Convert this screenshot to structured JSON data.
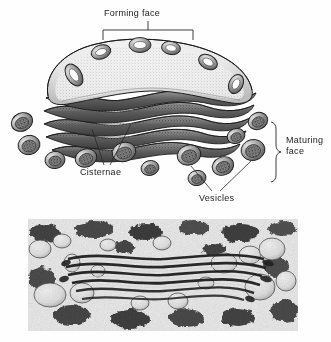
{
  "figure": {
    "title_text": "",
    "background_color": "#fefefe",
    "ink_color": "#1a1a1a"
  },
  "labels": {
    "forming_face": "Forming face",
    "cisternae": "Cisternae",
    "vesicles": "Vesicles",
    "maturing_face": "Maturing\nface"
  },
  "diagram": {
    "name": "golgi-apparatus-line-drawing",
    "cisterna_count": 5,
    "forming_face_vesicles": 6,
    "maturing_face_vesicles": 7,
    "bracket": {
      "x1": 103,
      "x2": 193,
      "y": 30,
      "tick_y": 21
    },
    "brace": {
      "x": 275,
      "y_top": 122,
      "y_bottom": 180
    }
  },
  "micrograph": {
    "name": "golgi-electron-micrograph",
    "x": 28,
    "y": 219,
    "width": 270,
    "height": 112,
    "caption": ""
  },
  "colors": {
    "ink": "#1a1a1a",
    "page": "#ffffff",
    "cisterna_light": "#dedede",
    "cisterna_dark": "#595959",
    "micrograph_light": "#e8e8e8",
    "micrograph_dark": "#1b1b1b"
  }
}
